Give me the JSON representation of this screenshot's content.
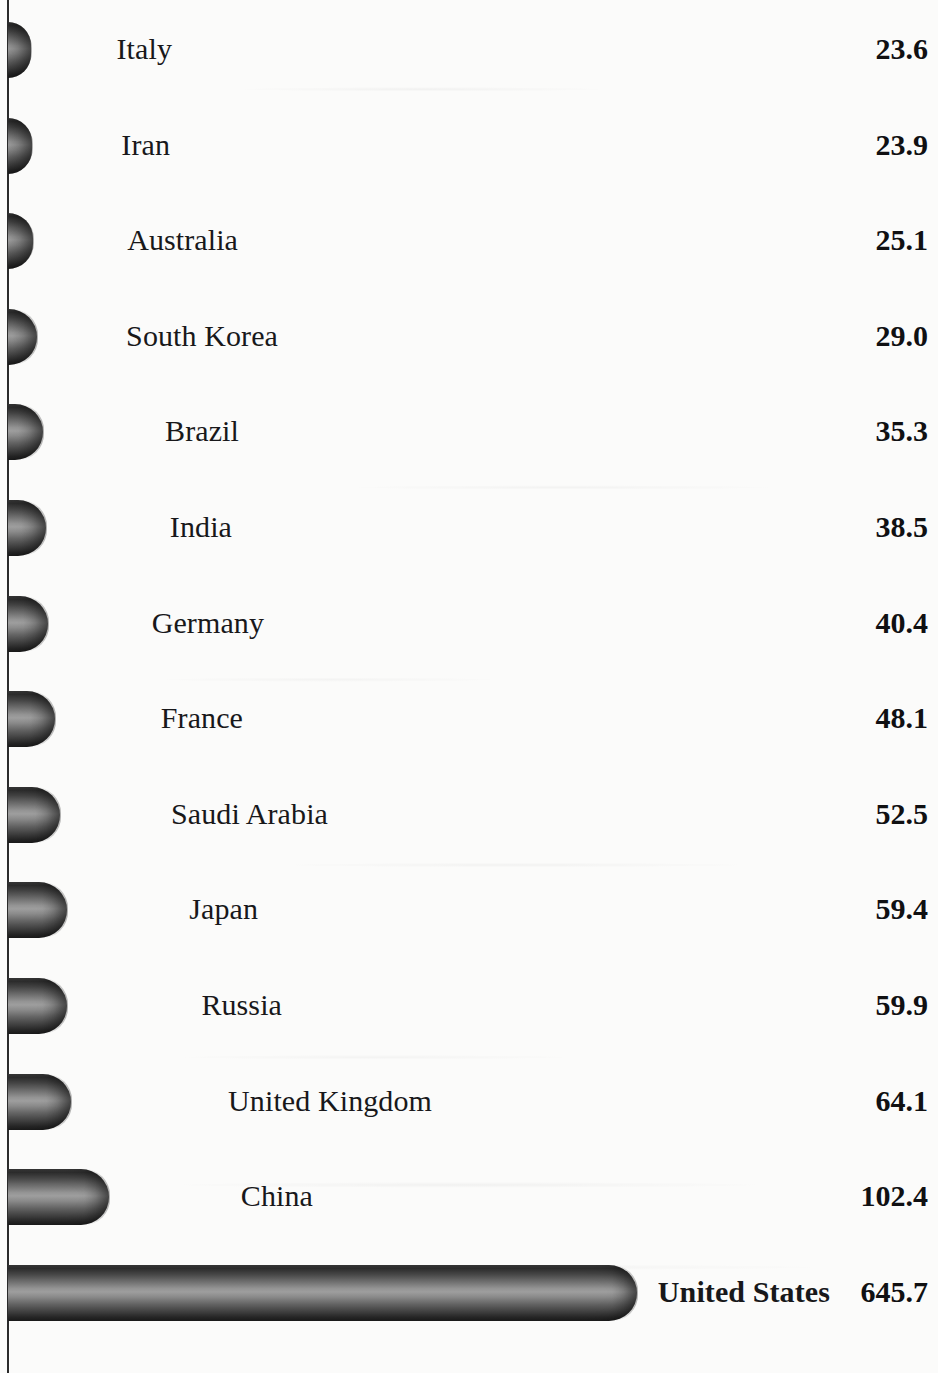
{
  "chart_data": {
    "type": "bar",
    "orientation": "horizontal",
    "title": "",
    "subtitle": "",
    "xlabel": "",
    "ylabel": "",
    "grid": false,
    "legend": null,
    "axis_line": true,
    "value_labels_shown": true,
    "xlim": [
      0,
      645.7
    ],
    "categories": [
      "Italy",
      "Iran",
      "Australia",
      "South Korea",
      "Brazil",
      "India",
      "Germany",
      "France",
      "Saudi Arabia",
      "Japan",
      "Russia",
      "United Kingdom",
      "China",
      "United States"
    ],
    "values": [
      23.6,
      23.9,
      25.1,
      29.0,
      35.3,
      38.5,
      40.4,
      48.1,
      52.5,
      59.4,
      59.9,
      64.1,
      102.4,
      645.7
    ],
    "value_labels": [
      "23.6",
      "23.9",
      "25.1",
      "29.0",
      "35.3",
      "38.5",
      "40.4",
      "48.1",
      "52.5",
      "59.4",
      "59.9",
      "64.1",
      "102.4",
      "645.7"
    ],
    "bar_style": "3d-cylinder",
    "bar_color": "#6f6f6f",
    "bar_color_dark": "#1c1c1c",
    "bar_color_light": "#9e9e9e",
    "text_color": "#18181a",
    "background_color": "#fbfbfa"
  },
  "rows": [
    {
      "label": "Italy",
      "value": "23.6",
      "bar_width": 23,
      "label_right": 172,
      "emphasis": false
    },
    {
      "label": "Iran",
      "value": "23.9",
      "bar_width": 24,
      "label_right": 170,
      "emphasis": false
    },
    {
      "label": "Australia",
      "value": "25.1",
      "bar_width": 25,
      "label_right": 238,
      "emphasis": false
    },
    {
      "label": "South Korea",
      "value": "29.0",
      "bar_width": 29,
      "label_right": 278,
      "emphasis": false
    },
    {
      "label": "Brazil",
      "value": "35.3",
      "bar_width": 35,
      "label_right": 239,
      "emphasis": false
    },
    {
      "label": "India",
      "value": "38.5",
      "bar_width": 38,
      "label_right": 232,
      "emphasis": false
    },
    {
      "label": "Germany",
      "value": "40.4",
      "bar_width": 40,
      "label_right": 264,
      "emphasis": false
    },
    {
      "label": "France",
      "value": "48.1",
      "bar_width": 47,
      "label_right": 243,
      "emphasis": false
    },
    {
      "label": "Saudi Arabia",
      "value": "52.5",
      "bar_width": 52,
      "label_right": 328,
      "emphasis": false
    },
    {
      "label": "Japan",
      "value": "59.4",
      "bar_width": 59,
      "label_right": 258,
      "emphasis": false
    },
    {
      "label": "Russia",
      "value": "59.9",
      "bar_width": 59,
      "label_right": 282,
      "emphasis": false
    },
    {
      "label": "United Kingdom",
      "value": "64.1",
      "bar_width": 63,
      "label_right": 432,
      "emphasis": false
    },
    {
      "label": "China",
      "value": "102.4",
      "bar_width": 101,
      "label_right": 313,
      "emphasis": false
    },
    {
      "label": "United States",
      "value": "645.7",
      "bar_width": 629,
      "label_right": 830,
      "emphasis": true
    }
  ]
}
